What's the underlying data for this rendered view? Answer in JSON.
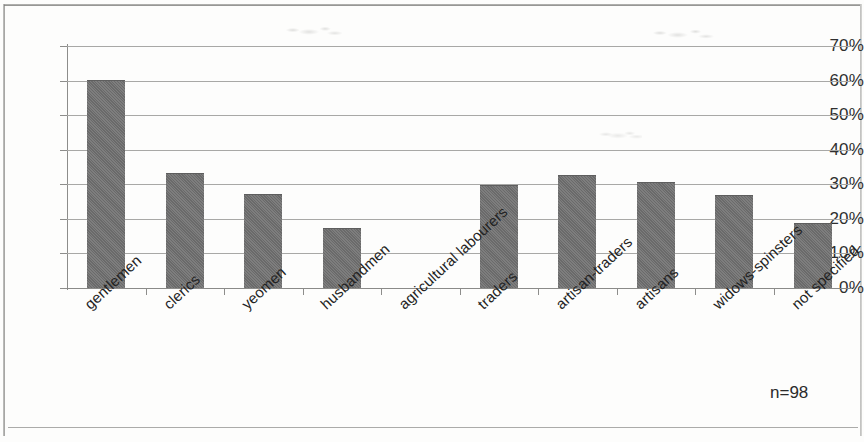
{
  "figure": {
    "annotation": "n=98",
    "bar_color": "#6f6f6f",
    "gridline_color": "#a8a8a6",
    "axis_color": "#8d8d8b",
    "text_color": "#232323",
    "background": "#fdfdfc"
  },
  "chart_data": {
    "type": "bar",
    "title": "",
    "subtitle": "",
    "xlabel": "",
    "ylabel": "",
    "categories": [
      "gentlemen",
      "clerics",
      "yeomen",
      "husbandmen",
      "agricultural labourers",
      "traders",
      "artisan-traders",
      "artisans",
      "widows-spinsters",
      "not specified"
    ],
    "values": [
      60,
      33,
      27,
      17,
      0,
      29.5,
      32.5,
      30.5,
      26.5,
      18.5
    ],
    "value_unit": "%",
    "ylim": [
      0,
      70
    ],
    "ytick_values": [
      0,
      10,
      20,
      30,
      40,
      50,
      60,
      70
    ],
    "ytick_labels": [
      "0%",
      "10%",
      "20%",
      "30%",
      "40%",
      "50%",
      "60%",
      "70%"
    ],
    "grid": true,
    "grid_axis": "y",
    "legend": false,
    "legend_position": "none",
    "annotations": [
      "n=98"
    ],
    "xtick_label_rotation": -43
  }
}
